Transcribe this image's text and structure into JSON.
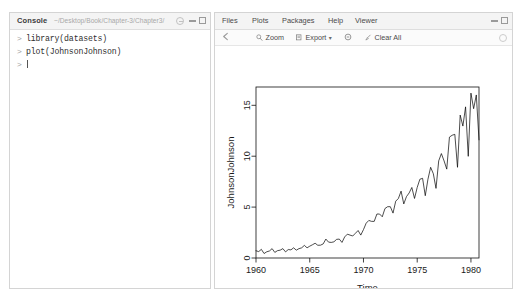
{
  "console": {
    "title": "Console",
    "path": "~/Desktop/Book/Chapter-3/Chapter3/",
    "prompt": ">",
    "lines": [
      {
        "prompt": ">",
        "text": "library(datasets)"
      },
      {
        "prompt": ">",
        "text": "plot(JohnsonJohnson)"
      }
    ],
    "icons": {
      "r_badge": "r-logo-icon",
      "minimize": "minimize-icon",
      "maximize": "maximize-icon"
    }
  },
  "plots_panel": {
    "tabs": [
      {
        "label": "Files",
        "active": false
      },
      {
        "label": "Plots",
        "active": false
      },
      {
        "label": "Packages",
        "active": false
      },
      {
        "label": "Help",
        "active": false
      },
      {
        "label": "Viewer",
        "active": false
      }
    ],
    "toolbar": {
      "back_icon": "back-arrow-icon",
      "zoom_label": "Zoom",
      "zoom_icon": "magnifier-icon",
      "export_label": "Export",
      "export_icon": "export-icon",
      "export_caret": "▾",
      "remove_icon": "remove-plot-icon",
      "clear_label": "Clear All",
      "clear_icon": "broom-icon",
      "refresh_icon": "refresh-icon"
    },
    "window_buttons": {
      "minimize": "minimize-icon",
      "maximize": "maximize-icon"
    }
  },
  "chart_data": {
    "type": "line",
    "title": "",
    "xlabel": "Time",
    "ylabel": "JohnsonJohnson",
    "xlim": [
      1960.0,
      1980.75
    ],
    "ylim": [
      0.0,
      16.8
    ],
    "xticks": [
      1960,
      1965,
      1970,
      1975,
      1980
    ],
    "xtick_labels": [
      "1960",
      "1965",
      "1970",
      "1975",
      "1980"
    ],
    "yticks": [
      0,
      5,
      10,
      15
    ],
    "ytick_labels": [
      "0",
      "5",
      "10",
      "15"
    ],
    "grid": false,
    "legend": false,
    "line_color": "#000000",
    "frequency": 4,
    "start_year": 1960,
    "x": [
      1960.0,
      1960.25,
      1960.5,
      1960.75,
      1961.0,
      1961.25,
      1961.5,
      1961.75,
      1962.0,
      1962.25,
      1962.5,
      1962.75,
      1963.0,
      1963.25,
      1963.5,
      1963.75,
      1964.0,
      1964.25,
      1964.5,
      1964.75,
      1965.0,
      1965.25,
      1965.5,
      1965.75,
      1966.0,
      1966.25,
      1966.5,
      1966.75,
      1967.0,
      1967.25,
      1967.5,
      1967.75,
      1968.0,
      1968.25,
      1968.5,
      1968.75,
      1969.0,
      1969.25,
      1969.5,
      1969.75,
      1970.0,
      1970.25,
      1970.5,
      1970.75,
      1971.0,
      1971.25,
      1971.5,
      1971.75,
      1972.0,
      1972.25,
      1972.5,
      1972.75,
      1973.0,
      1973.25,
      1973.5,
      1973.75,
      1974.0,
      1974.25,
      1974.5,
      1974.75,
      1975.0,
      1975.25,
      1975.5,
      1975.75,
      1976.0,
      1976.25,
      1976.5,
      1976.75,
      1977.0,
      1977.25,
      1977.5,
      1977.75,
      1978.0,
      1978.25,
      1978.5,
      1978.75,
      1979.0,
      1979.25,
      1979.5,
      1979.75,
      1980.0,
      1980.25,
      1980.5,
      1980.75
    ],
    "values": [
      0.71,
      0.63,
      0.85,
      0.44,
      0.61,
      0.69,
      0.92,
      0.55,
      0.72,
      0.77,
      0.92,
      0.6,
      0.83,
      0.8,
      1.0,
      0.77,
      0.92,
      1.0,
      1.24,
      1.0,
      1.16,
      1.3,
      1.45,
      1.25,
      1.26,
      1.38,
      1.86,
      1.56,
      1.53,
      1.59,
      1.83,
      1.86,
      1.53,
      2.07,
      2.34,
      2.25,
      2.16,
      2.43,
      2.7,
      2.25,
      2.79,
      3.42,
      3.69,
      3.6,
      3.6,
      4.32,
      4.32,
      4.05,
      4.86,
      5.04,
      5.04,
      4.41,
      5.58,
      5.85,
      6.57,
      5.31,
      6.03,
      6.39,
      6.93,
      5.85,
      6.93,
      7.74,
      7.83,
      6.12,
      7.74,
      8.91,
      8.28,
      6.84,
      9.54,
      10.26,
      9.54,
      8.73,
      11.88,
      12.06,
      12.15,
      8.91,
      14.04,
      12.96,
      14.85,
      9.99,
      16.2,
      14.67,
      16.02,
      11.61
    ]
  }
}
